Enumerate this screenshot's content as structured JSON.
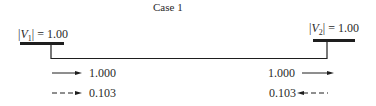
{
  "title": "Case 1",
  "buses": [
    {
      "id": 1,
      "label_prefix": "|",
      "label_var": "V",
      "label_sub": "1",
      "label_suffix": "| = 1.00"
    },
    {
      "id": 2,
      "label_prefix": "|",
      "label_var": "V",
      "label_sub": "2",
      "label_suffix": "| = 1.00"
    }
  ],
  "flows": {
    "left": {
      "real_power": "1.000",
      "reactive_power": "0.103"
    },
    "right": {
      "real_power": "1.000",
      "reactive_power": "0.103"
    }
  },
  "legend": {
    "solid_arrow": "real power flow",
    "dashed_arrow": "reactive power flow"
  },
  "colors": {
    "line": "#1e1e1e",
    "text": "#2a2a2a",
    "background": "#ffffff"
  }
}
